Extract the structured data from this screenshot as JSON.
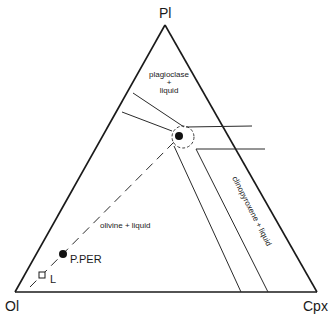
{
  "diagram": {
    "type": "ternary phase diagram",
    "vertices": {
      "top": {
        "label": "Pl"
      },
      "left": {
        "label": "Ol"
      },
      "right": {
        "label": "Cpx"
      }
    },
    "fields": {
      "plagioclase": {
        "line1": "plagioclase",
        "line2": "+",
        "line3": "liquid"
      },
      "olivine": {
        "label": "olivine + liquid"
      },
      "clinopyroxene": {
        "label": "clinopyroxene + liquid"
      }
    },
    "points": {
      "pper": {
        "label": "P.PER",
        "symbol": "filled-circle"
      },
      "l": {
        "label": "L",
        "symbol": "open-square"
      },
      "junction": {
        "symbol": "filled-circle-in-dashed-ellipse"
      }
    },
    "colors": {
      "line": "#1a1a1a",
      "background": "#ffffff"
    }
  }
}
